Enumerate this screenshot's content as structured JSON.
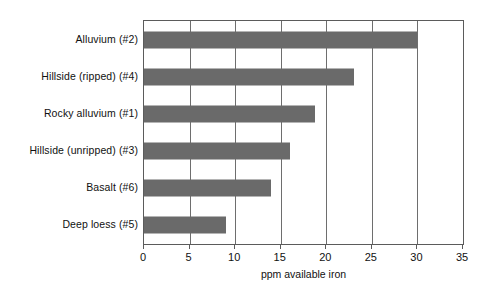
{
  "chart_data": {
    "type": "bar",
    "orientation": "horizontal",
    "title": "",
    "xlabel": "ppm available iron",
    "ylabel": "",
    "categories": [
      "Alluvium (#2)",
      "Hillside (ripped) (#4)",
      "Rocky alluvium (#1)",
      "Hillside (unripped) (#3)",
      "Basalt (#6)",
      "Deep loess (#5)"
    ],
    "values": [
      30,
      23,
      18.8,
      16,
      13.9,
      9
    ],
    "xlim": [
      0,
      35
    ],
    "xticks": [
      0,
      5,
      10,
      15,
      20,
      25,
      30,
      35
    ],
    "xtick_labels": [
      "0",
      "5",
      "10",
      "15",
      "20",
      "25",
      "30",
      "35"
    ],
    "gridlines_x": [
      5,
      10,
      15,
      20,
      25,
      30
    ],
    "grid": true,
    "legend": false,
    "bar_color": "#6a6a6a",
    "axis_color": "#5b5b5b",
    "background_color": "#ffffff"
  }
}
